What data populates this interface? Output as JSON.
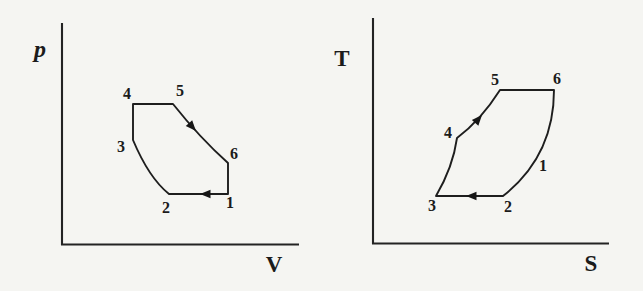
{
  "page": {
    "background": "#f5f5f2",
    "ink": "#1e1e1e"
  },
  "figures": [
    {
      "id": "pv-diagram",
      "type": "thermodynamic-cycle",
      "y_axis_label": "p",
      "x_axis_label": "V",
      "state_labels": [
        "1",
        "2",
        "3",
        "4",
        "5",
        "6"
      ],
      "processes": [
        {
          "from": "1",
          "to": "2",
          "shape": "horizontal",
          "arrow": "left"
        },
        {
          "from": "2",
          "to": "3",
          "shape": "curve-up-left",
          "arrow": ""
        },
        {
          "from": "3",
          "to": "4",
          "shape": "vertical-up",
          "arrow": ""
        },
        {
          "from": "4",
          "to": "5",
          "shape": "horizontal",
          "arrow": ""
        },
        {
          "from": "5",
          "to": "6",
          "shape": "curve-down-right",
          "arrow": "down-right"
        },
        {
          "from": "6",
          "to": "1",
          "shape": "vertical-down",
          "arrow": ""
        }
      ]
    },
    {
      "id": "ts-diagram",
      "type": "thermodynamic-cycle",
      "y_axis_label": "T",
      "x_axis_label": "S",
      "state_labels": [
        "1",
        "2",
        "3",
        "4",
        "5",
        "6"
      ],
      "processes": [
        {
          "from": "1",
          "to": "2",
          "shape": "curve-down-left",
          "arrow": ""
        },
        {
          "from": "2",
          "to": "3",
          "shape": "horizontal",
          "arrow": "left"
        },
        {
          "from": "3",
          "to": "4",
          "shape": "curve-up",
          "arrow": ""
        },
        {
          "from": "4",
          "to": "5",
          "shape": "line-up-right",
          "arrow": "up-right"
        },
        {
          "from": "5",
          "to": "6",
          "shape": "horizontal",
          "arrow": ""
        },
        {
          "from": "6",
          "to": "1",
          "shape": "curve-down",
          "arrow": ""
        }
      ]
    }
  ]
}
